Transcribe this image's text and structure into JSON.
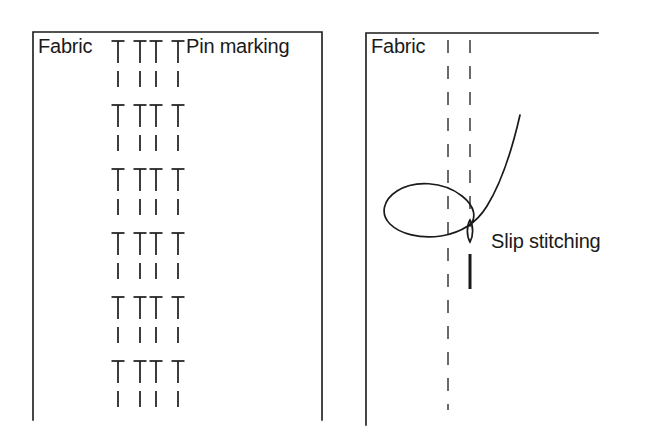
{
  "image": {
    "title": "Pin marking and slip stitching sewing diagram",
    "width": 657,
    "height": 446,
    "background_color": "#ffffff",
    "line_color": "#1a1a1a",
    "type": "technical-illustration"
  },
  "left_panel": {
    "name": "pin-marking-panel",
    "fabric_label": "Fabric",
    "pin_marking_label": "Pin marking",
    "border": {
      "left_x": 33,
      "right_x": 322,
      "top_y": 32,
      "bottom_y": 420,
      "sides": "left, right, top"
    },
    "pin_rows": 6,
    "pins_per_row": 4,
    "pin_columns_x": [
      118,
      140,
      156,
      178
    ],
    "pin_rows_y": [
      41,
      105,
      169,
      233,
      297,
      361
    ],
    "pin": {
      "head_width": 13,
      "stem_length": 22,
      "dash_gap": 8,
      "dash_length": 16
    }
  },
  "right_panel": {
    "name": "slip-stitching-panel",
    "fabric_label": "Fabric",
    "slip_stitching_label": "Slip stitching",
    "border": {
      "left_x": 366,
      "top_y": 33,
      "top_right_x": 598,
      "bottom_y": 425,
      "sides": "left, top"
    },
    "dashed_lines": [
      {
        "name": "fold-line-left",
        "x": 448,
        "y_start": 40,
        "y_end": 410
      },
      {
        "name": "fold-line-right",
        "x": 470,
        "y_start": 40,
        "y_end": 222
      }
    ],
    "needle": {
      "eye_center_x": 470,
      "eye_top_y": 220,
      "eye_bottom_y": 242,
      "eye_width": 7,
      "shaft_top_y": 254,
      "shaft_bottom_y": 289
    },
    "thread": {
      "description": "looped slip-stitch thread passing through needle eye",
      "upper_end": {
        "x": 520,
        "y": 115
      },
      "loop_left_extent_x": 383,
      "loop_top_y": 178,
      "loop_bottom_y": 240
    }
  }
}
